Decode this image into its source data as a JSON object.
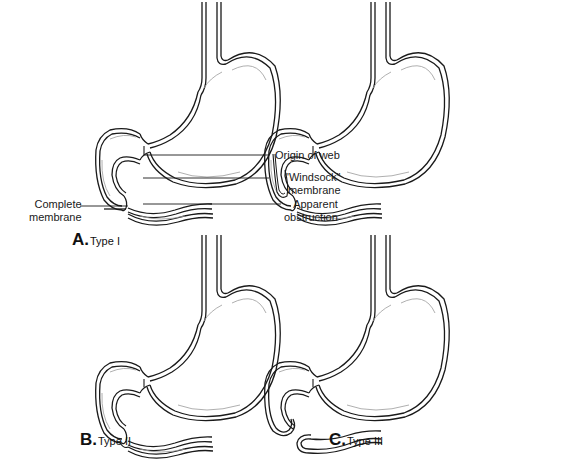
{
  "figure": {
    "panels": [
      {
        "id": "A",
        "letter": "A.",
        "caption": "Type I",
        "annotations": [
          {
            "text_line1": "Complete",
            "text_line2": "membrane"
          }
        ]
      },
      {
        "id": "web",
        "letter": "",
        "caption": "",
        "annotations": [
          {
            "text_line1": "Origin of web"
          },
          {
            "text_line1": "\"Windsock\"",
            "text_line2": "membrane"
          },
          {
            "text_line1": "Apparent",
            "text_line2": "obstruction"
          }
        ]
      },
      {
        "id": "B",
        "letter": "B.",
        "caption": "Type II",
        "annotations": []
      },
      {
        "id": "C",
        "letter": "C.",
        "caption": "Type III",
        "annotations": []
      }
    ],
    "colors": {
      "line": "#1a1a1a",
      "inner_line": "#9a9a9a",
      "background": "#ffffff"
    }
  }
}
